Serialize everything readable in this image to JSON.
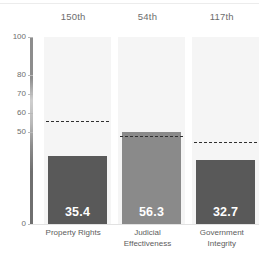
{
  "chart_data": {
    "type": "bar",
    "title": "",
    "subtitle": "",
    "xlabel": "",
    "ylabel": "",
    "categories": [
      "Property Rights",
      "Judicial Effectiveness",
      "Government Integrity"
    ],
    "values": [
      35.4,
      56.3,
      32.7
    ],
    "value_labels": [
      "35.4",
      "56.3",
      "32.7"
    ],
    "ranks": [
      "150th",
      "54th",
      "117th"
    ],
    "reference_lines": [
      51.7,
      46.7,
      44.6
    ],
    "ylim": [
      0,
      100
    ],
    "ytick_labels": [
      "100",
      "80",
      "70",
      "60",
      "50",
      "0"
    ],
    "ytick_values": [
      100,
      80,
      70,
      60,
      50,
      0
    ],
    "grid": false,
    "legend": "none",
    "bar_colors": [
      "#595959",
      "#8a8a8a",
      "#595959"
    ],
    "panel_color": "#f5f5f5",
    "reference_line_color": "#2f2f2f",
    "value_label_color": "#ffffff",
    "axis_label_color": "#6d6d6d",
    "category_label_color": "#5c5c5c"
  },
  "layout": {
    "plot_top_px": 37,
    "plot_bottom_px": 224,
    "tick_positions_px": [
      37,
      75,
      94,
      113,
      132,
      224
    ],
    "refline_positions_px": [
      121,
      136,
      142
    ],
    "bar_top_positions_px": [
      156,
      132,
      160
    ],
    "column_lefts_px": [
      8,
      82,
      156
    ],
    "column_width_px": 67
  }
}
